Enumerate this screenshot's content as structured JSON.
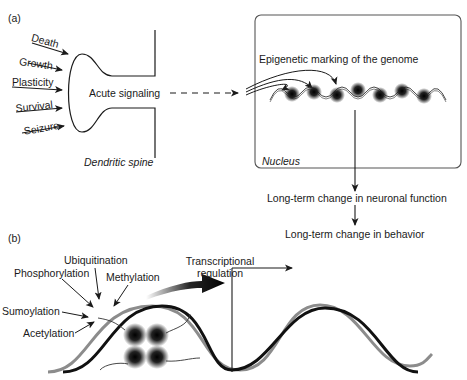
{
  "panel_a": {
    "label": "(a)",
    "inputs": [
      "Death",
      "Growth",
      "Plasticity",
      "Survival",
      "Seizure"
    ],
    "spine_label": "Acute signaling",
    "spine_caption": "Dendritic spine",
    "nucleus": {
      "title": "Epigenetic marking of the genome",
      "caption": "Nucleus"
    },
    "outcomes": [
      "Long-term change in neuronal function",
      "Long-term change in behavior"
    ]
  },
  "panel_b": {
    "label": "(b)",
    "modifications": [
      "Ubiquitination",
      "Phosphorylation",
      "Methylation",
      "Sumoylation",
      "Acetylation"
    ],
    "transcription_label_line1": "Transcriptional",
    "transcription_label_line2": "regulation"
  },
  "colors": {
    "line": "#1a1a1a",
    "grey_strand": "#8c8c8c",
    "box_border": "#555555"
  }
}
